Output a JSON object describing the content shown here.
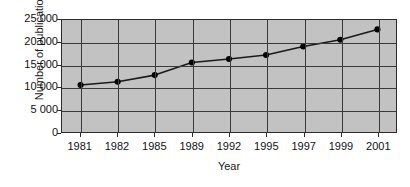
{
  "chart_data": {
    "type": "line",
    "title": "",
    "subtitle": "",
    "xlabel": "Year",
    "ylabel": "Number of publications",
    "categories": [
      "1981",
      "1982",
      "1985",
      "1989",
      "1992",
      "1995",
      "1997",
      "1999",
      "2001"
    ],
    "values": [
      10500,
      11200,
      12700,
      15500,
      16300,
      17200,
      19100,
      20600,
      22900
    ],
    "series": [
      {
        "name": "Number of publications",
        "values": [
          10500,
          11200,
          12700,
          15500,
          16300,
          17200,
          19100,
          20600,
          22900
        ]
      }
    ],
    "ylim": [
      0,
      25000
    ],
    "yticks": [
      0,
      5000,
      10000,
      15000,
      20000,
      25000
    ],
    "ytick_labels": [
      "0",
      "5 000",
      "10 000",
      "15 000",
      "20 000",
      "25 000"
    ],
    "grid": true,
    "grid_axis": "both",
    "legend": false,
    "legend_position": "none",
    "marker": "filled-circle",
    "line_color": "#1a1a1a",
    "marker_color": "#000000",
    "plot_background": "#c2c2c2",
    "figure_background": "#ffffff",
    "grid_color": "#3a3a3a",
    "axis_color": "#2b2b2b"
  }
}
